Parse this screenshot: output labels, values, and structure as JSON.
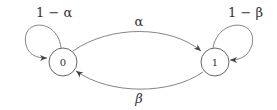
{
  "diagram": {
    "type": "markov-chain",
    "states": [
      {
        "id": "0",
        "label": "0"
      },
      {
        "id": "1",
        "label": "1"
      }
    ],
    "transitions": [
      {
        "from": "0",
        "to": "0",
        "label": "1 − α"
      },
      {
        "from": "0",
        "to": "1",
        "label": "α"
      },
      {
        "from": "1",
        "to": "0",
        "label": "β"
      },
      {
        "from": "1",
        "to": "1",
        "label": "1 − β"
      }
    ],
    "colors": {
      "stroke": "#555555",
      "text": "#333333",
      "background": "#ffffff"
    }
  }
}
